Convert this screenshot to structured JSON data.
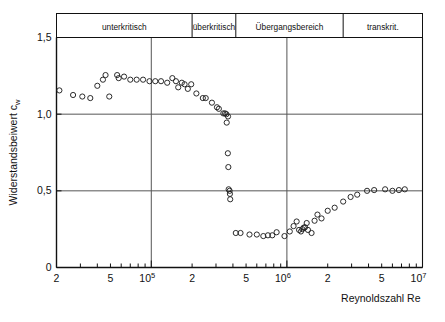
{
  "chart_data": {
    "type": "scatter",
    "title": "",
    "xlabel": "Reynoldszahl  Re",
    "ylabel": "Widerstandsbeiwert  c",
    "ylabel_sub": "w",
    "xscale": "log",
    "xlim": [
      20000,
      10000000
    ],
    "ylim": [
      0,
      1.5
    ],
    "grid": true,
    "gridlines_x": [
      100000,
      1000000
    ],
    "gridlines_y": [
      0.5,
      1.0
    ],
    "xticks_major": [
      {
        "value": 100000,
        "label": "10",
        "exp": "5"
      },
      {
        "value": 1000000,
        "label": "10",
        "exp": "6"
      },
      {
        "value": 10000000,
        "label": "10",
        "exp": "7"
      }
    ],
    "xticks_labeled": [
      {
        "value": 20000,
        "label": "2"
      },
      {
        "value": 50000,
        "label": "5"
      },
      {
        "value": 200000,
        "label": "2"
      },
      {
        "value": 500000,
        "label": "5"
      },
      {
        "value": 2000000,
        "label": "2"
      },
      {
        "value": 5000000,
        "label": "5"
      }
    ],
    "yticks": [
      {
        "value": 0,
        "label": "0"
      },
      {
        "value": 0.5,
        "label": "0,5"
      },
      {
        "value": 1.0,
        "label": "1,0"
      },
      {
        "value": 1.5,
        "label": "1,5"
      }
    ],
    "regions": [
      {
        "label": "unterkritisch",
        "from": 20000,
        "to": 200000
      },
      {
        "label": "überkritisch",
        "from": 200000,
        "to": 420000
      },
      {
        "label": "Übergangsbereich",
        "from": 420000,
        "to": 2600000
      },
      {
        "label": "transkrit.",
        "from": 2600000,
        "to": 10000000
      }
    ],
    "marker": {
      "shape": "circle-open",
      "radius": 2.6,
      "color": "#222222"
    },
    "points": [
      {
        "x": 21000,
        "y": 1.155
      },
      {
        "x": 26500,
        "y": 1.125
      },
      {
        "x": 31000,
        "y": 1.115
      },
      {
        "x": 35500,
        "y": 1.105
      },
      {
        "x": 40000,
        "y": 1.185
      },
      {
        "x": 44000,
        "y": 1.225
      },
      {
        "x": 46000,
        "y": 1.255
      },
      {
        "x": 49000,
        "y": 1.115
      },
      {
        "x": 56000,
        "y": 1.255
      },
      {
        "x": 57500,
        "y": 1.235
      },
      {
        "x": 63000,
        "y": 1.245
      },
      {
        "x": 70000,
        "y": 1.225
      },
      {
        "x": 78000,
        "y": 1.225
      },
      {
        "x": 87000,
        "y": 1.225
      },
      {
        "x": 97000,
        "y": 1.215
      },
      {
        "x": 107000,
        "y": 1.215
      },
      {
        "x": 118000,
        "y": 1.215
      },
      {
        "x": 131000,
        "y": 1.205
      },
      {
        "x": 143000,
        "y": 1.235
      },
      {
        "x": 152000,
        "y": 1.215
      },
      {
        "x": 158000,
        "y": 1.175
      },
      {
        "x": 168000,
        "y": 1.205
      },
      {
        "x": 176000,
        "y": 1.195
      },
      {
        "x": 186000,
        "y": 1.165
      },
      {
        "x": 197000,
        "y": 1.195
      },
      {
        "x": 215000,
        "y": 1.135
      },
      {
        "x": 240000,
        "y": 1.105
      },
      {
        "x": 252000,
        "y": 1.105
      },
      {
        "x": 280000,
        "y": 1.075
      },
      {
        "x": 305000,
        "y": 1.045
      },
      {
        "x": 315000,
        "y": 1.035
      },
      {
        "x": 340000,
        "y": 1.005
      },
      {
        "x": 350000,
        "y": 1.005
      },
      {
        "x": 358000,
        "y": 1.0
      },
      {
        "x": 368000,
        "y": 0.985
      },
      {
        "x": 360000,
        "y": 0.945
      },
      {
        "x": 367000,
        "y": 0.745
      },
      {
        "x": 370000,
        "y": 0.655
      },
      {
        "x": 372000,
        "y": 0.51
      },
      {
        "x": 378000,
        "y": 0.5
      },
      {
        "x": 380000,
        "y": 0.48
      },
      {
        "x": 382000,
        "y": 0.445
      },
      {
        "x": 420000,
        "y": 0.225
      },
      {
        "x": 455000,
        "y": 0.225
      },
      {
        "x": 530000,
        "y": 0.215
      },
      {
        "x": 600000,
        "y": 0.215
      },
      {
        "x": 670000,
        "y": 0.205
      },
      {
        "x": 725000,
        "y": 0.21
      },
      {
        "x": 780000,
        "y": 0.21
      },
      {
        "x": 840000,
        "y": 0.23
      },
      {
        "x": 960000,
        "y": 0.205
      },
      {
        "x": 1050000,
        "y": 0.235
      },
      {
        "x": 1120000,
        "y": 0.27
      },
      {
        "x": 1180000,
        "y": 0.3
      },
      {
        "x": 1230000,
        "y": 0.245
      },
      {
        "x": 1270000,
        "y": 0.235
      },
      {
        "x": 1300000,
        "y": 0.25
      },
      {
        "x": 1330000,
        "y": 0.26
      },
      {
        "x": 1360000,
        "y": 0.262
      },
      {
        "x": 1400000,
        "y": 0.29
      },
      {
        "x": 1430000,
        "y": 0.245
      },
      {
        "x": 1520000,
        "y": 0.225
      },
      {
        "x": 1600000,
        "y": 0.305
      },
      {
        "x": 1680000,
        "y": 0.345
      },
      {
        "x": 1800000,
        "y": 0.32
      },
      {
        "x": 2000000,
        "y": 0.37
      },
      {
        "x": 2250000,
        "y": 0.39
      },
      {
        "x": 2600000,
        "y": 0.43
      },
      {
        "x": 2950000,
        "y": 0.46
      },
      {
        "x": 3300000,
        "y": 0.475
      },
      {
        "x": 3900000,
        "y": 0.5
      },
      {
        "x": 4400000,
        "y": 0.505
      },
      {
        "x": 5300000,
        "y": 0.51
      },
      {
        "x": 6000000,
        "y": 0.5
      },
      {
        "x": 6700000,
        "y": 0.505
      },
      {
        "x": 7400000,
        "y": 0.51
      }
    ]
  }
}
